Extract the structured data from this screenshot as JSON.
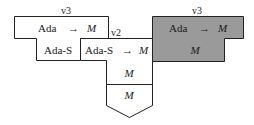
{
  "diagram": {
    "left_block": {
      "label": "v3",
      "top_type": "Ada",
      "arrow": "→",
      "top_result": "M",
      "bottom": "Ada-S"
    },
    "middle_block": {
      "label": "v2",
      "top_type": "Ada-S",
      "arrow": "→",
      "top_result": "M",
      "stack": [
        "M",
        "M"
      ]
    },
    "right_block": {
      "label": "v3",
      "top_type": "Ada",
      "arrow": "→",
      "top_result": "M",
      "bottom": "M",
      "fill": "#9a9a9a"
    }
  }
}
